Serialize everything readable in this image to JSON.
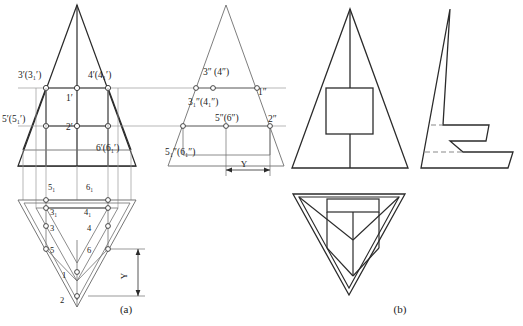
{
  "figure": {
    "title_a": "(a)",
    "title_b": "(b)",
    "dimension_label_front": "Y",
    "dimension_label_side": "Y"
  },
  "labels": {
    "front_view": [
      {
        "id": "l-3p",
        "text": "3′(3₁′)",
        "x": 18,
        "y": 78
      },
      {
        "id": "l-4p",
        "text": "4′(4₁′)",
        "x": 88,
        "y": 78
      },
      {
        "id": "l-1p",
        "text": "1′",
        "x": 66,
        "y": 101
      },
      {
        "id": "l-5p",
        "text": "5′(5₁′)",
        "x": 2,
        "y": 122
      },
      {
        "id": "l-2p",
        "text": "2′",
        "x": 66,
        "y": 130
      },
      {
        "id": "l-6p",
        "text": "6′(6₁′)",
        "x": 96,
        "y": 151
      }
    ],
    "side_view": [
      {
        "id": "l-3pp",
        "text": "3″ (4″)",
        "x": 203,
        "y": 75
      },
      {
        "id": "l-1pp",
        "text": "1″",
        "x": 255,
        "y": 94
      },
      {
        "id": "l-3ipp",
        "text": "3₁″(4₁″)",
        "x": 190,
        "y": 104
      },
      {
        "id": "l-5pp",
        "text": "5″(6″)",
        "x": 218,
        "y": 127
      },
      {
        "id": "l-2pp",
        "text": "2″",
        "x": 266,
        "y": 124
      },
      {
        "id": "l-5ipp",
        "text": "5₁″(6₁″)",
        "x": 186,
        "y": 155
      }
    ],
    "bottom_view": [
      {
        "id": "l-5i",
        "text": "5₁",
        "x": 48,
        "y": 187
      },
      {
        "id": "l-6i",
        "text": "6₁",
        "x": 84,
        "y": 187
      },
      {
        "id": "l-3i",
        "text": "3₁",
        "x": 54,
        "y": 212
      },
      {
        "id": "l-4i",
        "text": "4₁",
        "x": 80,
        "y": 212
      },
      {
        "id": "l-3",
        "text": "3",
        "x": 54,
        "y": 230
      },
      {
        "id": "l-4",
        "text": "4",
        "x": 81,
        "y": 230
      },
      {
        "id": "l-5",
        "text": "5",
        "x": 54,
        "y": 252
      },
      {
        "id": "l-6",
        "text": "6",
        "x": 80,
        "y": 252
      },
      {
        "id": "l-1",
        "text": "1",
        "x": 58,
        "y": 276
      },
      {
        "id": "l-2",
        "text": "2",
        "x": 56,
        "y": 300
      }
    ]
  },
  "colors": {
    "line": "#2b2b2b",
    "thin_line": "#6e6e6e",
    "projection_line": "#9a9a9a",
    "background": "#ffffff",
    "node_fill": "#ffffff"
  },
  "views": {
    "front_view_name": "front-view-projection",
    "side_view_name": "side-view-projection",
    "bottom_view_name": "bottom-view-projection",
    "solution_front_name": "solution-front-view",
    "solution_side_name": "solution-side-view",
    "solution_bottom_name": "solution-bottom-view"
  }
}
